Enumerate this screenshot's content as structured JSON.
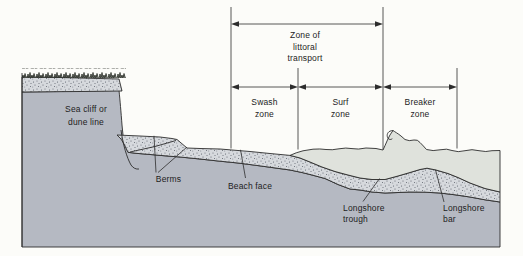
{
  "colors": {
    "background": "#fcfcf9",
    "water": "#dfe2dc",
    "sand": "#d6d9dd",
    "substrate": "#b5b9c2",
    "line": "#2d2d2d",
    "stipple_dot": "#565c66",
    "veg": "#2f332c",
    "text": "#1d1d1d"
  },
  "diagram": {
    "cliff_label_1": "Sea cliff or",
    "cliff_label_2": "dune line",
    "littoral_1": "Zone of",
    "littoral_2": "littoral",
    "littoral_3": "transport",
    "swash_1": "Swash",
    "swash_2": "zone",
    "surf_1": "Surf",
    "surf_2": "zone",
    "breaker_1": "Breaker",
    "breaker_2": "zone",
    "berms": "Berms",
    "beach_face": "Beach face",
    "trough_1": "Longshore",
    "trough_2": "trough",
    "bar_1": "Longshore",
    "bar_2": "bar"
  }
}
